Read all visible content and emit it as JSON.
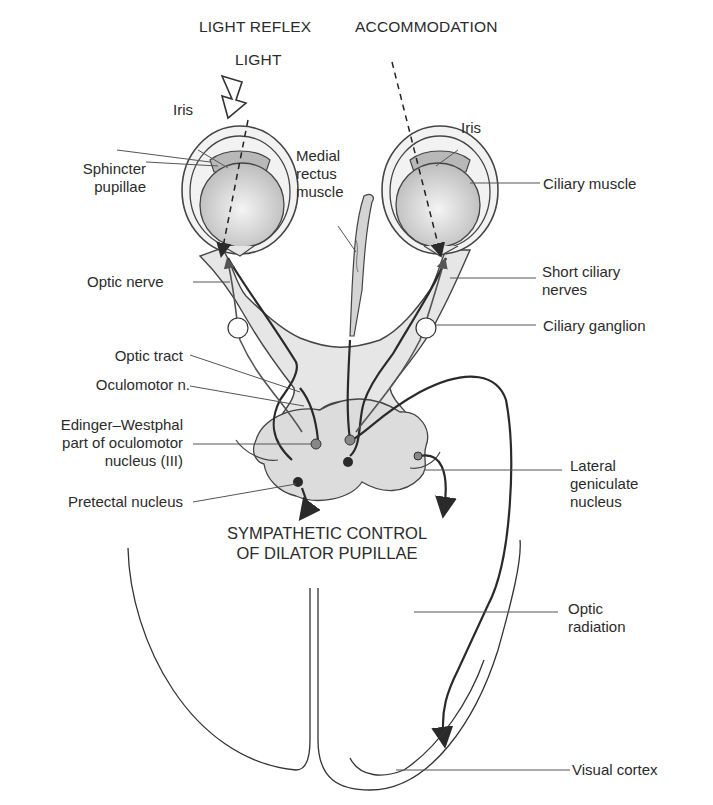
{
  "headings": {
    "light_reflex": "LIGHT REFLEX",
    "accommodation": "ACCOMMODATION",
    "light": "LIGHT"
  },
  "labels": {
    "iris_left": "Iris",
    "iris_right": "Iris",
    "sphincter_pupillae": [
      "Sphincter",
      "pupillae"
    ],
    "medial_rectus": [
      "Medial",
      "rectus",
      "muscle"
    ],
    "ciliary_muscle": "Ciliary muscle",
    "optic_nerve": "Optic nerve",
    "short_ciliary_nerves": [
      "Short ciliary",
      "nerves"
    ],
    "ciliary_ganglion": "Ciliary ganglion",
    "optic_tract": "Optic tract",
    "oculomotor_n": "Oculomotor n.",
    "edinger_westphal": [
      "Edinger–Westphal",
      "part of oculomotor",
      "nucleus (III)"
    ],
    "pretectal_nucleus": "Pretectal nucleus",
    "lateral_geniculate": [
      "Lateral",
      "geniculate",
      "nucleus"
    ],
    "sympathetic_control": [
      "SYMPATHETIC CONTROL",
      "OF DILATOR PUPILLAE"
    ],
    "optic_radiation": [
      "Optic",
      "radiation"
    ],
    "visual_cortex": "Visual cortex"
  },
  "colors": {
    "line": "#2a2a2a",
    "tissue_fill": "#e6e6e6",
    "lens_fill": "#cfcfcf",
    "iris_fill": "#b8b8b8",
    "nucleus_fill": "#dcdcdc"
  }
}
